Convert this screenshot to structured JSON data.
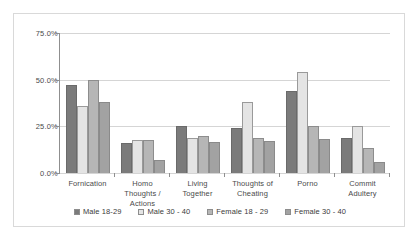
{
  "chart_data": {
    "type": "bar",
    "title": "",
    "xlabel": "",
    "ylabel": "",
    "ylim": [
      0,
      75
    ],
    "grid": true,
    "legend_position": "bottom",
    "ytick_labels": [
      "75.0%",
      "50.0%",
      "25.0%",
      "0.0%"
    ],
    "ytick_values": [
      75,
      50,
      25,
      0
    ],
    "categories": [
      "Fornication",
      "Homo Thoughts / Actions",
      "Living Together",
      "Thoughts of Cheating",
      "Porno",
      "Commit Adultery"
    ],
    "category_lines": [
      [
        "Fornication"
      ],
      [
        "Homo",
        "Thoughts /",
        "Actions"
      ],
      [
        "Living",
        "Together"
      ],
      [
        "Thoughts of",
        "Cheating"
      ],
      [
        "Porno"
      ],
      [
        "Commit",
        "Adultery"
      ]
    ],
    "series": [
      {
        "name": "Male 18-29",
        "color": "#7b7b7b",
        "values": [
          47.0,
          16.0,
          25.0,
          24.0,
          44.0,
          18.5
        ]
      },
      {
        "name": "Male 30 - 40",
        "color": "#e4e4e4",
        "values": [
          36.0,
          17.5,
          18.5,
          38.0,
          54.0,
          25.0
        ]
      },
      {
        "name": "Female 18 - 29",
        "color": "#b6b6b6",
        "values": [
          50.0,
          17.5,
          20.0,
          19.0,
          25.0,
          13.5
        ]
      },
      {
        "name": "Female 30 - 40",
        "color": "#a2a2a2",
        "values": [
          38.0,
          7.0,
          16.5,
          17.0,
          18.0,
          6.0
        ]
      }
    ]
  }
}
